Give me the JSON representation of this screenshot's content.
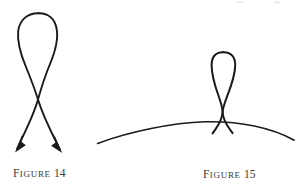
{
  "page": {
    "background_color": "#ffffff",
    "ink_color": "#1a1a1a",
    "caption_color": "#3b3b3b",
    "width": 296,
    "height": 187
  },
  "figures": [
    {
      "id": "figure-14",
      "caption_lead": "F",
      "caption_rest": "IGURE",
      "caption_number": "14",
      "caption_full": "FIGURE 14",
      "description": "Teardrop loop with two strands crossing and terminating in arrowheads",
      "has_arrowheads": true,
      "arrowhead_count": 2,
      "has_baseline_arc": false,
      "loop_top_y": 13,
      "crossing_point": [
        38,
        100
      ],
      "arrow_tips": [
        [
          15,
          152
        ],
        [
          62,
          153
        ]
      ]
    },
    {
      "id": "figure-15",
      "caption_lead": "F",
      "caption_rest": "IGURE",
      "caption_number": "15",
      "caption_full": "FIGURE 15",
      "description": "Narrow vertical loop resting on a shallow convex arc with short tails below",
      "has_arrowheads": false,
      "arrowhead_count": 0,
      "has_baseline_arc": true,
      "loop_top_y": 52,
      "crossing_point": [
        222,
        112
      ],
      "arc_left_end": [
        98,
        143
      ],
      "arc_apex": [
        205,
        122
      ],
      "arc_right_end": [
        294,
        140
      ]
    }
  ]
}
